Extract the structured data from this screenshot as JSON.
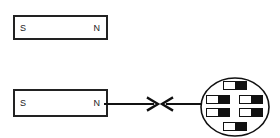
{
  "figure": {
    "background_color": "#ffffff",
    "stroke_color": "#222222"
  },
  "magnets": [
    {
      "id": "magnet-top",
      "south_label": "S",
      "north_label": "N",
      "x": 13,
      "y": 15,
      "width": 95,
      "height": 25
    },
    {
      "id": "magnet-bottom",
      "south_label": "S",
      "north_label": "N",
      "x": 13,
      "y": 89,
      "width": 95,
      "height": 28
    }
  ],
  "force_arrows": {
    "description": "two arrowheads pointing toward each other indicating attraction",
    "left_arrow_direction": "right",
    "right_arrow_direction": "left",
    "meeting_x": 56,
    "line_color": "#111111"
  },
  "object": {
    "shape": "circle",
    "cx": 36,
    "cy": 30,
    "r": 30,
    "stroke_color": "#111111",
    "fill_color": "#ffffff",
    "domains": [
      {
        "x": 24,
        "y": 5,
        "w": 24,
        "h": 9,
        "south": "white",
        "north": "black"
      },
      {
        "x": 8,
        "y": 19,
        "w": 24,
        "h": 9,
        "south": "white",
        "north": "black"
      },
      {
        "x": 40,
        "y": 19,
        "w": 24,
        "h": 9,
        "south": "white",
        "north": "black"
      },
      {
        "x": 8,
        "y": 32,
        "w": 24,
        "h": 9,
        "south": "white",
        "north": "black"
      },
      {
        "x": 40,
        "y": 32,
        "w": 24,
        "h": 9,
        "south": "white",
        "north": "black"
      },
      {
        "x": 24,
        "y": 46,
        "w": 24,
        "h": 9,
        "south": "white",
        "north": "black"
      }
    ]
  }
}
